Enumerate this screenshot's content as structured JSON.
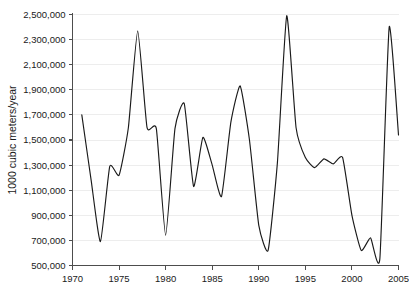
{
  "chart_data": {
    "type": "line",
    "title": "",
    "xlabel": "",
    "ylabel": "1000 cubic meters/year",
    "xlim": [
      1970,
      2005
    ],
    "ylim": [
      500000,
      2500000
    ],
    "grid": true,
    "legend": "none",
    "xticks": [
      1970,
      1975,
      1980,
      1985,
      1990,
      1995,
      2000,
      2005
    ],
    "xtick_labels": [
      "1970",
      "1975",
      "1980",
      "1985",
      "1990",
      "1995",
      "2000",
      "2005"
    ],
    "yticks": [
      500000,
      700000,
      900000,
      1100000,
      1300000,
      1500000,
      1700000,
      1900000,
      2100000,
      2300000,
      2500000
    ],
    "ytick_labels": [
      "500,000",
      "700,000",
      "900,000",
      "1,100,000",
      "1,300,000",
      "1,500,000",
      "1,700,000",
      "1,900,000",
      "2,100,000",
      "2,300,000",
      "2,500,000"
    ],
    "line_color": "#1a1a1a",
    "grid_color": "#ededed",
    "axis_color": "#4d4d4d",
    "x": [
      1971,
      1972,
      1973,
      1974,
      1975,
      1976,
      1977,
      1978,
      1979,
      1980,
      1981,
      1982,
      1983,
      1984,
      1985,
      1986,
      1987,
      1988,
      1989,
      1990,
      1991,
      1992,
      1993,
      1994,
      1995,
      1996,
      1997,
      1998,
      1999,
      2000,
      2001,
      2002,
      2003,
      2004,
      2005
    ],
    "values": [
      1700000,
      1180000,
      690000,
      1290000,
      1220000,
      1600000,
      2370000,
      1600000,
      1590000,
      740000,
      1590000,
      1790000,
      1130000,
      1520000,
      1300000,
      1050000,
      1640000,
      1930000,
      1500000,
      820000,
      620000,
      1320000,
      2490000,
      1600000,
      1360000,
      1280000,
      1350000,
      1310000,
      1360000,
      900000,
      620000,
      720000,
      555000,
      2400000,
      1540000
    ]
  }
}
